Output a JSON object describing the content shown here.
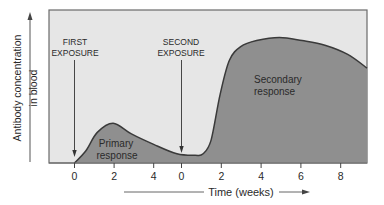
{
  "chart_data": {
    "type": "area",
    "title": "",
    "xlabel": "Time (weeks)",
    "ylabel_line1": "Antibody concentration",
    "ylabel_line2": "in blood",
    "x_tick_labels": [
      "0",
      "2",
      "4",
      "0",
      "2",
      "4",
      "6",
      "8"
    ],
    "x_ticks": [
      {
        "label": "0",
        "segment": "first",
        "week": 0
      },
      {
        "label": "2",
        "segment": "first",
        "week": 2
      },
      {
        "label": "4",
        "segment": "first",
        "week": 4
      },
      {
        "label": "0",
        "segment": "second",
        "week": 0
      },
      {
        "label": "2",
        "segment": "second",
        "week": 2
      },
      {
        "label": "4",
        "segment": "second",
        "week": 4
      },
      {
        "label": "6",
        "segment": "second",
        "week": 6
      },
      {
        "label": "8",
        "segment": "second",
        "week": 8
      }
    ],
    "y_range_relative": [
      0,
      1
    ],
    "curve_relative": [
      {
        "t": 0.0,
        "y": 0.0
      },
      {
        "t": 0.5,
        "y": 0.08
      },
      {
        "t": 1.0,
        "y": 0.2
      },
      {
        "t": 1.7,
        "y": 0.26
      },
      {
        "t": 2.5,
        "y": 0.19
      },
      {
        "t": 3.5,
        "y": 0.12
      },
      {
        "t": 4.5,
        "y": 0.06
      },
      {
        "t": 5.3,
        "y": 0.05
      },
      {
        "t": 5.65,
        "y": 0.06
      },
      {
        "t": 6.0,
        "y": 0.15
      },
      {
        "t": 6.4,
        "y": 0.45
      },
      {
        "t": 6.8,
        "y": 0.67
      },
      {
        "t": 7.3,
        "y": 0.76
      },
      {
        "t": 8.0,
        "y": 0.8
      },
      {
        "t": 9.0,
        "y": 0.82
      },
      {
        "t": 10.0,
        "y": 0.8
      },
      {
        "t": 11.0,
        "y": 0.77
      },
      {
        "t": 12.0,
        "y": 0.71
      },
      {
        "t": 12.85,
        "y": 0.62
      }
    ],
    "curve_note": "t = elapsed weeks from first exposure (second exposure at t≈5.4); y = relative antibody concentration (0–1 of axis height)",
    "annotations": {
      "first_exposure": [
        "FIRST",
        "EXPOSURE"
      ],
      "second_exposure": [
        "SECOND",
        "EXPOSURE"
      ],
      "primary_response": [
        "Primary",
        "response"
      ],
      "secondary_response": [
        "Secondary",
        "response"
      ]
    },
    "grid": false,
    "legend": "none"
  },
  "colors": {
    "plot_bg": "#e6e6e6",
    "fill": "#8f8f8f",
    "curve": "#3a3a3a",
    "frame": "#6a6a6a",
    "text": "#2a2a2a"
  }
}
